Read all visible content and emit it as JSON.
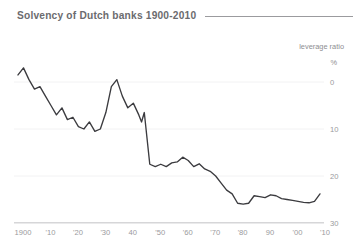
{
  "header": {
    "title": "Solvency of Dutch banks 1900-2010"
  },
  "legend": {
    "label": "leverage ratio",
    "unit": "%"
  },
  "axis": {
    "y_ticks": [
      "30",
      "20",
      "10",
      "0"
    ],
    "y_unit_label": "%",
    "x_ticks": [
      "1900",
      "'10",
      "'20",
      "'30",
      "40",
      "'50",
      "'60",
      "'70",
      "'80",
      "90",
      "'00",
      "'10"
    ]
  },
  "colors": {
    "line": "#3b3b3f",
    "grid": "#f2f2f3",
    "axis": "#d6d6d8",
    "title": "#6b6b6e",
    "tick_text": "#9a9a9d"
  },
  "chart_data": {
    "type": "line",
    "title": "Solvency of Dutch banks 1900-2010",
    "subtitle": "",
    "xlabel": "",
    "ylabel": "leverage ratio %",
    "xlim": [
      1900,
      2010
    ],
    "ylim": [
      0,
      33
    ],
    "grid": true,
    "legend_position": "top-right",
    "yticks": [
      0,
      10,
      20,
      30
    ],
    "xticks": [
      1900,
      1910,
      1920,
      1930,
      1940,
      1950,
      1960,
      1970,
      1980,
      1990,
      2000,
      2010
    ],
    "xticklabels": [
      "1900",
      "'10",
      "'20",
      "'30",
      "40",
      "'50",
      "'60",
      "'70",
      "'80",
      "90",
      "'00",
      "'10"
    ],
    "series": [
      {
        "name": "leverage ratio",
        "x": [
          1900,
          1902,
          1904,
          1906,
          1908,
          1910,
          1912,
          1914,
          1916,
          1918,
          1920,
          1922,
          1924,
          1926,
          1928,
          1930,
          1932,
          1934,
          1936,
          1938,
          1940,
          1942,
          1944,
          1945,
          1946,
          1948,
          1950,
          1952,
          1954,
          1956,
          1958,
          1960,
          1962,
          1964,
          1966,
          1968,
          1970,
          1972,
          1974,
          1976,
          1978,
          1980,
          1982,
          1984,
          1986,
          1988,
          1990,
          1992,
          1994,
          1996,
          1998,
          2000,
          2002,
          2004,
          2006,
          2008,
          2010
        ],
        "y": [
          31.5,
          33.0,
          30.5,
          28.5,
          29.0,
          27.0,
          25.0,
          23.0,
          24.5,
          22.0,
          22.5,
          20.5,
          20.0,
          21.5,
          19.5,
          20.0,
          23.5,
          29.0,
          30.5,
          27.0,
          24.5,
          25.5,
          23.0,
          21.5,
          23.5,
          12.5,
          12.0,
          12.5,
          12.0,
          12.8,
          13.0,
          14.0,
          13.3,
          12.0,
          12.6,
          11.5,
          11.0,
          10.0,
          8.5,
          7.0,
          6.2,
          4.2,
          4.0,
          4.2,
          5.8,
          5.6,
          5.4,
          6.0,
          5.8,
          5.2,
          5.0,
          4.8,
          4.6,
          4.4,
          4.3,
          4.6,
          6.2
        ]
      }
    ]
  }
}
